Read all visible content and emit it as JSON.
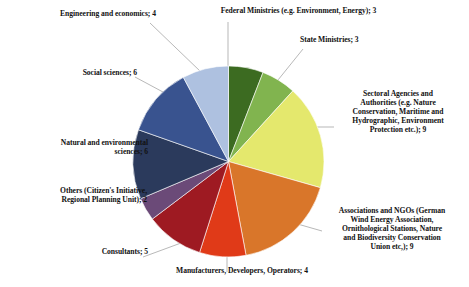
{
  "chart_data": {
    "type": "pie",
    "title": "",
    "total": 51,
    "start_angle_deg": 0,
    "direction": "clockwise",
    "legend": "outside-labels-with-leader-lines",
    "grid": false,
    "categories": [
      "Federal Ministries (e.g. Environment, Energy)",
      "State Ministries",
      "Sectoral Agencies and Authorities (e.g. Nature Conservation, Maritime and Hydrographic, Environment Protection etc.)",
      "Associations and NGOs (German Wind Energy Association, Ornithological Stations, Nature and Biodiversity Conservation Union etc,)",
      "Manufacturers, Developers, Operators",
      "Consultants",
      "Others (Citizen's Initiative, Regional Planning Unit)",
      "Natural and environmental sciences",
      "Social sciences",
      "Engineering and economics"
    ],
    "values": [
      3,
      3,
      9,
      9,
      4,
      5,
      2,
      6,
      6,
      4
    ],
    "colors": [
      "#3c6b21",
      "#81b44f",
      "#e4e86d",
      "#d9762a",
      "#e03a18",
      "#9e1a22",
      "#6b4a78",
      "#2b3a5c",
      "#39538f",
      "#aec1e0"
    ]
  },
  "labels": {
    "federal": "Federal Ministries (e.g. Environment, Energy); 3",
    "state": "State Ministries; 3",
    "sectoral": "Sectoral Agencies and\nAuthorities (e.g. Nature\nConservation, Maritime and\nHydrographic, Environment\nProtection etc.); 9",
    "associations": "Associations and NGOs (German\nWind Energy Association,\nOrnithological Stations, Nature\nand Biodiversity Conservation\nUnion etc,); 9",
    "manufacturers": "Manufacturers, Developers, Operators; 4",
    "consultants": "Consultants; 5",
    "others": "Others (Citizen's Initiative,\nRegional Planning Unit); 2",
    "natural": "Natural and environmental\nsciences; 6",
    "social": "Social sciences; 6",
    "engineering": "Engineering and economics; 4"
  }
}
